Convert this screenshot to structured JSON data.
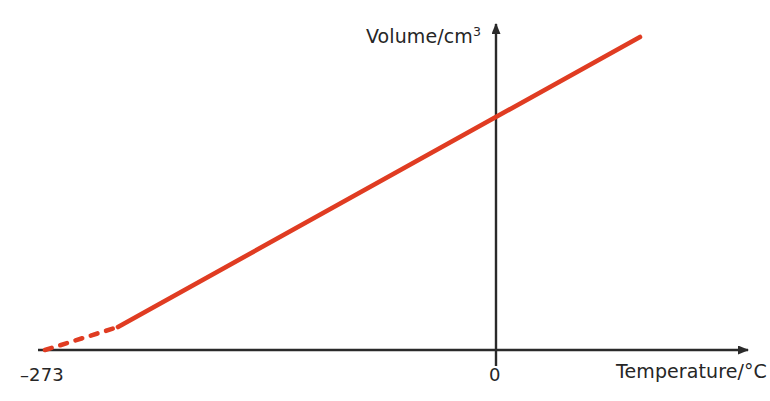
{
  "chart_data": {
    "type": "line",
    "title": "",
    "subtitle": "",
    "xlabel": "Temperature/°C",
    "ylabel_text": "Volume/cm",
    "ylabel_sup": "3",
    "ylabel_full": "Volume/cm³",
    "grid": false,
    "legend": "none",
    "annotations": [],
    "xticks": [
      "–273",
      "0"
    ],
    "xtick_values": [
      -273,
      0
    ],
    "yticks": [],
    "xlim": [
      -300,
      90
    ],
    "ylim": [
      0,
      1.2
    ],
    "axis_arrows": {
      "x": "right",
      "y": "up"
    },
    "series": [
      {
        "name": "Volume vs Temperature (measured)",
        "style": "solid",
        "color": "#e03c22",
        "x": [
          -235,
          0,
          75
        ],
        "y": [
          0.088,
          0.9,
          1.16
        ]
      },
      {
        "name": "Extrapolation to absolute zero",
        "style": "dashed",
        "color": "#e03c22",
        "x": [
          -273,
          -235
        ],
        "y": [
          0.0,
          0.088
        ]
      }
    ]
  },
  "colors": {
    "line": "#e03c22",
    "axis": "#2a2a2a",
    "text": "#262626",
    "background": "#ffffff"
  },
  "geometry": {
    "x_axis_y": 350,
    "y_axis_x": 496,
    "x_axis_start": 38,
    "x_axis_end": 755,
    "y_axis_top": 17,
    "y_axis_bottom": 366,
    "line_solid_start": [
      118,
      327
    ],
    "line_solid_end": [
      640,
      37
    ],
    "line_dashed_start": [
      45,
      350
    ],
    "line_dashed_end": [
      118,
      327
    ]
  }
}
